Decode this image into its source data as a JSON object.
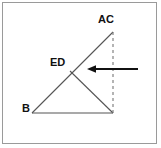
{
  "figure": {
    "background_color": "#ffffff",
    "frame_color": "#9a9a9a",
    "stroke_color": "#555555",
    "arrow_color": "#111111",
    "dash_color": "#777777",
    "labels": [
      {
        "id": "ac",
        "text": "AC",
        "x": 98,
        "y": 14
      },
      {
        "id": "ed",
        "text": "ED",
        "x": 50,
        "y": 57
      },
      {
        "id": "b",
        "text": "B",
        "x": 22,
        "y": 103
      }
    ],
    "points": {
      "apex": {
        "name": "AC",
        "x": 113,
        "y": 32
      },
      "left_vertex": {
        "name": "B",
        "x": 32,
        "y": 113
      },
      "right_vertex": {
        "name": "C",
        "x": 113,
        "y": 113
      },
      "mid_point": {
        "name": "ED",
        "x": 70,
        "y": 71
      }
    },
    "segments": [
      {
        "id": "hypotenuse-ac-to-b",
        "x1": 113,
        "y1": 32,
        "x2": 32,
        "y2": 113,
        "style": "solid"
      },
      {
        "id": "base-b-to-c",
        "x1": 32,
        "y1": 113,
        "x2": 113,
        "y2": 113,
        "style": "solid"
      },
      {
        "id": "ed-to-c",
        "x1": 70,
        "y1": 71,
        "x2": 113,
        "y2": 113,
        "style": "solid"
      },
      {
        "id": "vertical-ac-to-c",
        "x1": 113,
        "y1": 32,
        "x2": 113,
        "y2": 113,
        "style": "dashed"
      }
    ],
    "arrow": {
      "id": "force-arrow",
      "direction": "left",
      "x_tail": 138,
      "x_tip": 88,
      "y": 69
    }
  }
}
